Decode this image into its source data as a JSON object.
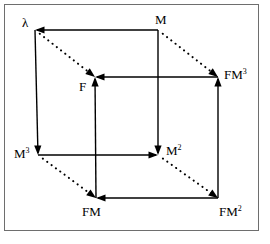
{
  "figure": {
    "kind": "commutative-cube-diagram",
    "width": 270,
    "height": 244,
    "background_color": "#ffffff",
    "line_color": "#000000",
    "frame_color": "#6e6e6e",
    "caption_fragment": ""
  },
  "vertices": [
    {
      "id": "lambda",
      "label_base": "λ",
      "label_sup": "",
      "x": 35,
      "y": 30,
      "label_x": 22,
      "label_y": 16
    },
    {
      "id": "M",
      "label_base": "M",
      "label_sup": "",
      "x": 158,
      "y": 30,
      "label_x": 155,
      "label_y": 13
    },
    {
      "id": "F",
      "label_base": "F",
      "label_sup": "",
      "x": 95,
      "y": 77,
      "label_x": 79,
      "label_y": 80
    },
    {
      "id": "FM3",
      "label_base": "FM",
      "label_sup": "3",
      "x": 218,
      "y": 77,
      "label_x": 224,
      "label_y": 68
    },
    {
      "id": "M3",
      "label_base": "M",
      "label_sup": "3",
      "x": 38,
      "y": 155,
      "label_x": 14,
      "label_y": 147
    },
    {
      "id": "M2",
      "label_base": "M",
      "label_sup": "2",
      "x": 158,
      "y": 155,
      "label_x": 166,
      "label_y": 144
    },
    {
      "id": "FM",
      "label_base": "FM",
      "label_sup": "",
      "x": 96,
      "y": 198,
      "label_x": 82,
      "label_y": 205
    },
    {
      "id": "FM2",
      "label_base": "FM",
      "label_sup": "2",
      "x": 218,
      "y": 198,
      "label_x": 219,
      "label_y": 205
    }
  ],
  "edges": [
    {
      "id": "M-to-lambda",
      "from": "M",
      "to": "lambda",
      "style": "solid",
      "arrow_at": "to"
    },
    {
      "id": "lambda-to-M3",
      "from": "lambda",
      "to": "M3",
      "style": "solid",
      "arrow_at": "to"
    },
    {
      "id": "M3-to-M2",
      "from": "M3",
      "to": "M2",
      "style": "solid",
      "arrow_at": "to"
    },
    {
      "id": "M-to-M2",
      "from": "M",
      "to": "M2",
      "style": "solid",
      "arrow_at": "to"
    },
    {
      "id": "FM3-to-F",
      "from": "FM3",
      "to": "F",
      "style": "solid",
      "arrow_at": "to"
    },
    {
      "id": "FM-to-F",
      "from": "FM",
      "to": "F",
      "style": "solid",
      "arrow_at": "to"
    },
    {
      "id": "FM2-to-FM",
      "from": "FM2",
      "to": "FM",
      "style": "solid",
      "arrow_at": "to"
    },
    {
      "id": "FM2-to-FM3",
      "from": "FM2",
      "to": "FM3",
      "style": "solid",
      "arrow_at": "to"
    },
    {
      "id": "lambda-to-F",
      "from": "lambda",
      "to": "F",
      "style": "dotted",
      "arrow_at": "to"
    },
    {
      "id": "M-to-FM3",
      "from": "M",
      "to": "FM3",
      "style": "dotted",
      "arrow_at": "to"
    },
    {
      "id": "M3-to-FM",
      "from": "M3",
      "to": "FM",
      "style": "dotted",
      "arrow_at": "to"
    },
    {
      "id": "M2-to-FM2",
      "from": "M2",
      "to": "FM2",
      "style": "dotted",
      "arrow_at": "to"
    }
  ]
}
